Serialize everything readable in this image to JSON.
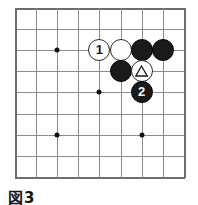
{
  "figure": {
    "caption": "図3",
    "kind": "go-board-diagram"
  },
  "board": {
    "columns": 9,
    "rows": 9,
    "origin_x": 15,
    "origin_y": 8,
    "spacing": 21.1,
    "line_color": "#8c8c8c",
    "edge_color": "#6e6e6e",
    "background_color": "#ffffff",
    "star_points": [
      {
        "name": "star-point-upper-left",
        "col": 2,
        "row": 2
      },
      {
        "name": "star-point-center",
        "col": 4,
        "row": 4
      },
      {
        "name": "star-point-lower-left",
        "col": 2,
        "row": 6
      },
      {
        "name": "star-point-lower-right",
        "col": 6,
        "row": 6
      }
    ]
  },
  "stones": [
    {
      "id": "white-move-1",
      "name": "white-stone-1",
      "color": "white",
      "col": 4,
      "row": 2,
      "label": "1",
      "mark": "number"
    },
    {
      "id": "white-plain-a",
      "name": "white-stone-plain",
      "color": "white",
      "col": 5,
      "row": 2,
      "label": "",
      "mark": "none"
    },
    {
      "id": "black-plain-a",
      "name": "black-stone-plain",
      "color": "black",
      "col": 6,
      "row": 2,
      "label": "",
      "mark": "none"
    },
    {
      "id": "black-plain-b",
      "name": "black-stone-plain",
      "color": "black",
      "col": 7,
      "row": 2,
      "label": "",
      "mark": "none"
    },
    {
      "id": "black-plain-c",
      "name": "black-stone-plain",
      "color": "black",
      "col": 5,
      "row": 3,
      "label": "",
      "mark": "none"
    },
    {
      "id": "white-triangle",
      "name": "white-stone-triangle-marked",
      "color": "white",
      "col": 6,
      "row": 3,
      "label": "△",
      "mark": "triangle"
    },
    {
      "id": "black-move-2",
      "name": "black-stone-2",
      "color": "black",
      "col": 6,
      "row": 4,
      "label": "2",
      "mark": "number"
    }
  ],
  "colors": {
    "black_stone": "#1a1a1a",
    "white_stone": "#ffffff",
    "stone_outline": "#2b2b2b",
    "text": "#151515"
  }
}
